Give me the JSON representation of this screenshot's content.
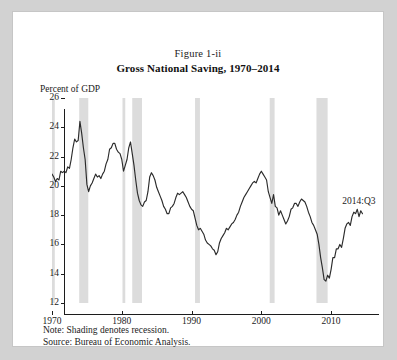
{
  "figure": {
    "number": "Figure 1-ii",
    "title": "Gross National Saving, 1970–2014",
    "y_axis_title": "Percent of GDP",
    "annotation": "2014:Q3",
    "note": "Note: Shading denotes recession.",
    "source": "Source: Bureau of Economic Analysis."
  },
  "colors": {
    "paper": "#ffffff",
    "page": "#d2d2d2",
    "line": "#2b2b2b",
    "recession_band": "#dcdcdc",
    "axis": "#1c1c1c",
    "text": "#1b1b1b"
  },
  "chart_data": {
    "type": "line",
    "title": "Gross National Saving, 1970–2014",
    "subtitle": "Figure 1-ii",
    "xlabel": "",
    "ylabel": "Percent of GDP",
    "xlim": [
      1970,
      2015
    ],
    "ylim": [
      12,
      26
    ],
    "ytick_values": [
      12,
      14,
      16,
      18,
      20,
      22,
      24,
      26
    ],
    "xtick_values": [
      1970,
      1980,
      1990,
      2000,
      2010
    ],
    "ytick_labels": [
      "12",
      "14",
      "16",
      "18",
      "20",
      "22",
      "24",
      "26"
    ],
    "xtick_labels": [
      "1970",
      "1980",
      "1990",
      "2000",
      "2010"
    ],
    "grid": false,
    "legend": null,
    "annotations": [
      {
        "text": "2014:Q3",
        "x": 2011.6,
        "y": 18.9
      }
    ],
    "recession_bands": [
      {
        "label": "1969–70 recession",
        "start": 1969.9,
        "end": 1970.4
      },
      {
        "label": "1973–75 recession",
        "start": 1973.9,
        "end": 1975.2
      },
      {
        "label": "1980 recession",
        "start": 1980.1,
        "end": 1980.5
      },
      {
        "label": "1981–82 recession",
        "start": 1981.5,
        "end": 1982.9
      },
      {
        "label": "1990–91 recession",
        "start": 1990.5,
        "end": 1991.2
      },
      {
        "label": "2001 recession",
        "start": 2001.2,
        "end": 2001.9
      },
      {
        "label": "2007–09 recession",
        "start": 2007.9,
        "end": 2009.5
      }
    ],
    "series": [
      {
        "name": "Gross national saving",
        "x": [
          1970.0,
          1970.25,
          1970.5,
          1970.75,
          1971.0,
          1971.25,
          1971.5,
          1971.75,
          1972.0,
          1972.25,
          1972.5,
          1972.75,
          1973.0,
          1973.25,
          1973.5,
          1973.75,
          1974.0,
          1974.25,
          1974.5,
          1974.75,
          1975.0,
          1975.25,
          1975.5,
          1975.75,
          1976.0,
          1976.25,
          1976.5,
          1976.75,
          1977.0,
          1977.25,
          1977.5,
          1977.75,
          1978.0,
          1978.25,
          1978.5,
          1978.75,
          1979.0,
          1979.25,
          1979.5,
          1979.75,
          1980.0,
          1980.25,
          1980.5,
          1980.75,
          1981.0,
          1981.25,
          1981.5,
          1981.75,
          1982.0,
          1982.25,
          1982.5,
          1982.75,
          1983.0,
          1983.25,
          1983.5,
          1983.75,
          1984.0,
          1984.25,
          1984.5,
          1984.75,
          1985.0,
          1985.25,
          1985.5,
          1985.75,
          1986.0,
          1986.25,
          1986.5,
          1986.75,
          1987.0,
          1987.25,
          1987.5,
          1987.75,
          1988.0,
          1988.25,
          1988.5,
          1988.75,
          1989.0,
          1989.25,
          1989.5,
          1989.75,
          1990.0,
          1990.25,
          1990.5,
          1990.75,
          1991.0,
          1991.25,
          1991.5,
          1991.75,
          1992.0,
          1992.25,
          1992.5,
          1992.75,
          1993.0,
          1993.25,
          1993.5,
          1993.75,
          1994.0,
          1994.25,
          1994.5,
          1994.75,
          1995.0,
          1995.25,
          1995.5,
          1995.75,
          1996.0,
          1996.25,
          1996.5,
          1996.75,
          1997.0,
          1997.25,
          1997.5,
          1997.75,
          1998.0,
          1998.25,
          1998.5,
          1998.75,
          1999.0,
          1999.25,
          1999.5,
          1999.75,
          2000.0,
          2000.25,
          2000.5,
          2000.75,
          2001.0,
          2001.25,
          2001.5,
          2001.75,
          2002.0,
          2002.25,
          2002.5,
          2002.75,
          2003.0,
          2003.25,
          2003.5,
          2003.75,
          2004.0,
          2004.25,
          2004.5,
          2004.75,
          2005.0,
          2005.25,
          2005.5,
          2005.75,
          2006.0,
          2006.25,
          2006.5,
          2006.75,
          2007.0,
          2007.25,
          2007.5,
          2007.75,
          2008.0,
          2008.25,
          2008.5,
          2008.75,
          2009.0,
          2009.25,
          2009.5,
          2009.75,
          2010.0,
          2010.25,
          2010.5,
          2010.75,
          2011.0,
          2011.25,
          2011.5,
          2011.75,
          2012.0,
          2012.25,
          2012.5,
          2012.75,
          2013.0,
          2013.25,
          2013.5,
          2013.75,
          2014.0,
          2014.25,
          2014.5
        ],
        "y": [
          20.8,
          20.6,
          20.3,
          20.5,
          20.4,
          21.0,
          20.9,
          21.0,
          20.9,
          21.3,
          21.2,
          21.8,
          22.6,
          23.2,
          23.0,
          23.1,
          24.4,
          23.6,
          22.6,
          21.8,
          20.1,
          19.6,
          20.0,
          20.2,
          20.5,
          20.8,
          20.6,
          20.7,
          20.5,
          20.8,
          21.0,
          21.5,
          21.8,
          22.5,
          22.6,
          22.9,
          22.9,
          22.5,
          22.3,
          22.2,
          21.8,
          21.0,
          21.4,
          21.8,
          22.6,
          23.0,
          22.2,
          21.4,
          20.4,
          19.5,
          19.0,
          18.7,
          18.6,
          18.9,
          19.0,
          19.6,
          20.6,
          20.9,
          20.7,
          20.4,
          19.9,
          19.6,
          19.3,
          19.0,
          18.6,
          18.4,
          18.1,
          18.1,
          18.5,
          18.6,
          18.8,
          19.2,
          19.5,
          19.4,
          19.5,
          19.6,
          19.4,
          19.2,
          18.9,
          18.6,
          18.4,
          18.3,
          17.8,
          17.3,
          17.0,
          17.1,
          16.9,
          16.7,
          16.3,
          16.1,
          16.0,
          15.9,
          15.7,
          15.6,
          15.3,
          15.5,
          16.1,
          16.4,
          16.6,
          16.8,
          17.1,
          17.0,
          17.2,
          17.4,
          17.5,
          17.7,
          18.0,
          18.2,
          18.6,
          18.9,
          19.2,
          19.4,
          19.6,
          19.8,
          20.0,
          20.2,
          20.3,
          20.2,
          20.5,
          20.8,
          21.0,
          20.8,
          20.6,
          20.4,
          19.6,
          19.2,
          18.8,
          19.4,
          18.6,
          18.5,
          18.0,
          18.3,
          18.0,
          17.7,
          17.4,
          17.6,
          17.9,
          18.4,
          18.5,
          18.8,
          18.8,
          18.6,
          18.9,
          19.1,
          19.0,
          18.9,
          18.6,
          18.2,
          17.9,
          17.5,
          17.3,
          17.0,
          16.7,
          16.0,
          15.1,
          14.4,
          13.6,
          13.5,
          13.9,
          13.7,
          14.3,
          15.1,
          15.1,
          15.7,
          15.7,
          16.0,
          15.8,
          16.4,
          17.1,
          17.4,
          17.5,
          17.3,
          17.9,
          18.2,
          18.1,
          18.4,
          17.9,
          18.3,
          18.1
        ]
      }
    ]
  }
}
